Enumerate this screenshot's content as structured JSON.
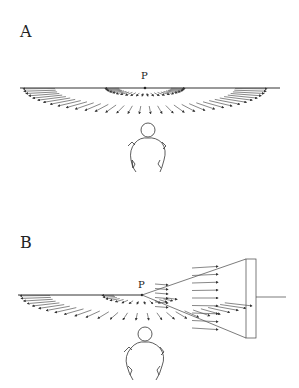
{
  "figure": {
    "panels": [
      {
        "id": "A",
        "label": "A",
        "point_label": "P",
        "description": "Observer facing horizon line; arrows radiate around point P toward the viewer"
      },
      {
        "id": "B",
        "label": "B",
        "point_label": "P",
        "description": "Same as A, but with a wedge/cone from P to a vertical plane on the right; arrows inside the wedge point toward the plane"
      }
    ],
    "colors": {
      "ink": "#333333",
      "background": "#ffffff"
    }
  }
}
